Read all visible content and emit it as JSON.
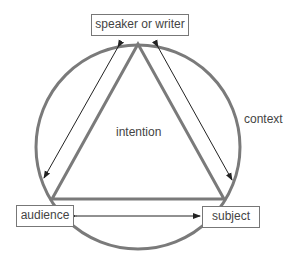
{
  "diagram": {
    "nodes": {
      "top": "speaker or writer",
      "left": "audience",
      "right": "subject"
    },
    "center_label": "intention",
    "outer_label": "context",
    "colors": {
      "circle": "#7a7a7a",
      "triangle": "#7a7a7a",
      "arrows": "#222222",
      "text": "#444444"
    }
  }
}
